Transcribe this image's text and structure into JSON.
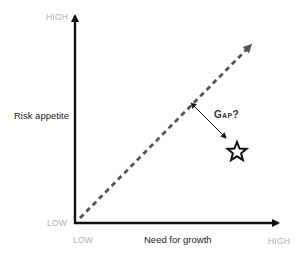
{
  "diagram": {
    "y_axis": {
      "title": "Risk appetite",
      "high_label": "HIGH",
      "low_label": "LOW"
    },
    "x_axis": {
      "title": "Need for growth",
      "high_label": "HIGH",
      "low_label": "LOW"
    },
    "annotation": {
      "gap_label": "Gap?"
    },
    "marker": {
      "shape": "star-icon"
    },
    "colors": {
      "axis": "#111111",
      "dashed_line": "#555555",
      "tick_labels": "#b0b0b0",
      "text": "#222222"
    }
  }
}
